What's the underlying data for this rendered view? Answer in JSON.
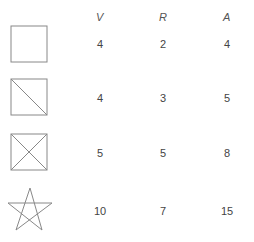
{
  "headers": [
    "V",
    "R",
    "A"
  ],
  "rows": [
    {
      "figure": "square-icon",
      "V": "4",
      "R": "2",
      "A": "4"
    },
    {
      "figure": "square-one-diagonal-icon",
      "V": "4",
      "R": "3",
      "A": "5"
    },
    {
      "figure": "square-two-diagonals-icon",
      "V": "5",
      "R": "5",
      "A": "8"
    },
    {
      "figure": "pentagram-star-icon",
      "V": "10",
      "R": "7",
      "A": "15"
    }
  ]
}
